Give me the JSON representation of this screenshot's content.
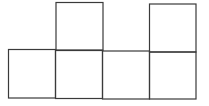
{
  "diagram": {
    "type": "net-of-squares",
    "stroke_color": "#3a3a3a",
    "background": "#ffffff",
    "cells": [
      {
        "id": "top-1",
        "row": 0,
        "col": 1,
        "x": 56,
        "y": 2,
        "w": 47,
        "h": 48
      },
      {
        "id": "top-2",
        "row": 0,
        "col": 3,
        "x": 149,
        "y": 4,
        "w": 47,
        "h": 48
      },
      {
        "id": "bottom-1",
        "row": 1,
        "col": 0,
        "x": 8,
        "y": 49,
        "w": 47,
        "h": 49
      },
      {
        "id": "bottom-2",
        "row": 1,
        "col": 1,
        "x": 55,
        "y": 50,
        "w": 47,
        "h": 49
      },
      {
        "id": "bottom-3",
        "row": 1,
        "col": 2,
        "x": 102,
        "y": 51,
        "w": 47,
        "h": 48
      },
      {
        "id": "bottom-4",
        "row": 1,
        "col": 3,
        "x": 149,
        "y": 52,
        "w": 47,
        "h": 47
      }
    ]
  }
}
